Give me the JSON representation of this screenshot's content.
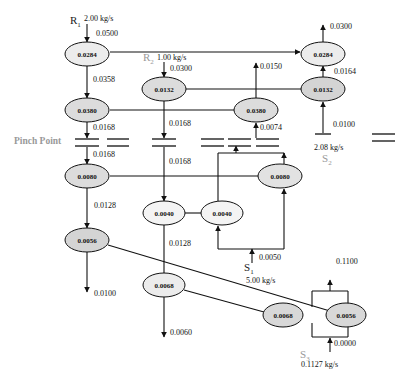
{
  "colors": {
    "node_fill": "#e6e6e6",
    "node_stroke": "#111111",
    "line": "#111111",
    "pinch_label": "#999999"
  },
  "pinch_label": "Pinch Point",
  "sources": {
    "R1": {
      "name": "R",
      "sub": "1",
      "flow": "2.00 kg/s",
      "conc": "0.0500"
    },
    "R2": {
      "name": "R",
      "sub": "2",
      "flow": "1.00 kg/s",
      "conc": "0.0300"
    },
    "S1": {
      "name": "S",
      "sub": "1",
      "flow": "5.00 kg/s",
      "conc": "0.0050"
    },
    "S2": {
      "name": "S",
      "sub": "2",
      "flow": "2.08 kg/s",
      "conc": "0.0100"
    },
    "S3": {
      "name": "S",
      "sub": "3",
      "flow": "0.1127 kg/s",
      "conc": "0.0000"
    }
  },
  "nodes": {
    "n1": "0.0284",
    "n2": "0.0380",
    "n3": "0.0080",
    "n4": "0.0056",
    "n5": "0.0132",
    "n6": "0.0380",
    "n7": "0.0284",
    "n8": "0.0132",
    "n9": "0.0040",
    "n10": "0.0040",
    "n11": "0.0080",
    "n12": "0.0068",
    "n13": "0.0068",
    "n14": "0.0056"
  },
  "edges": {
    "e_n1_n2": "0.0358",
    "e_n2_down": "0.0168",
    "e_pinch_n3": "0.0168",
    "e_n5_down": "0.0168",
    "e_pinch_n9": "0.0168",
    "e_n3_n4": "0.0128",
    "e_n4_out": "0.0100",
    "e_n9_n12": "0.0128",
    "e_n12_out": "0.0060",
    "e_n6_out": "0.0150",
    "e_n6_in": "0.0074",
    "e_n7_out": "0.0300",
    "e_n8_n7": "0.0164",
    "e_s3_out": "0.1100"
  }
}
